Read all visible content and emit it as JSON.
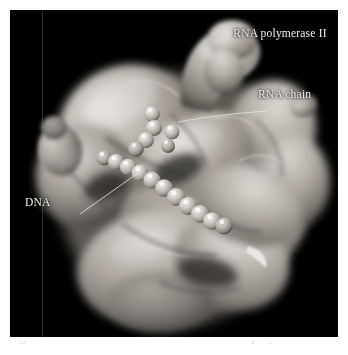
{
  "figure": {
    "kind": "molecular-surface-rendering",
    "background_color": "#000000",
    "page_color": "#ffffff",
    "surface_color": "#b9b4ae",
    "label_color": "#f2f0ec",
    "leader_line_color": "#e8e6e2",
    "width": 348,
    "height": 355,
    "panel": {
      "x": 10,
      "y": 10,
      "width": 328,
      "height": 327
    }
  },
  "labels": {
    "polymerase": "RNA polymerase II",
    "rna_chain": "RNA chain",
    "dna": "DNA"
  },
  "caption": {
    "text": "Figure 21-17 Model of the structure of RNA polymerase II in the"
  },
  "structures": [
    {
      "name": "rna-polymerase-surface",
      "description": "large lobed protein surface"
    },
    {
      "name": "dna-bead-chain",
      "description": "chain of spheres running diagonally"
    },
    {
      "name": "rna-bead-chain",
      "description": "short chain of spheres near cleft"
    }
  ]
}
